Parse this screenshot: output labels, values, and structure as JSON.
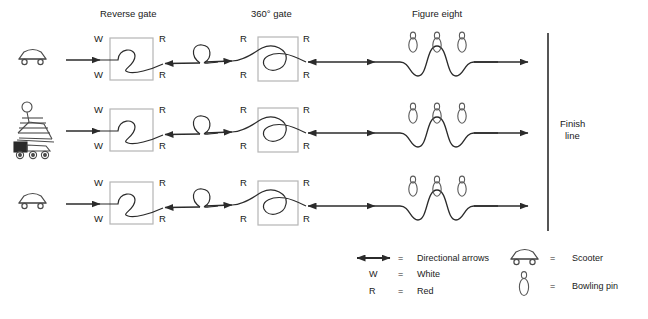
{
  "diagram": {
    "section_headers": [
      {
        "label": "Reverse gate",
        "x": 100,
        "y": 8
      },
      {
        "label": "360° gate",
        "x": 251,
        "y": 8
      },
      {
        "label": "Figure eight",
        "x": 410,
        "y": 8
      },
      {
        "label": "Finish",
        "x": 564,
        "y": 119
      },
      {
        "label": "line",
        "x": 567,
        "y": 131
      }
    ],
    "finish_line": {
      "x": 548,
      "y_top": 33,
      "y_bottom": 231,
      "color": "#2b2b2b"
    },
    "rows": [
      {
        "id": "row-1",
        "vehicle": "scooter",
        "baseline_y": 60,
        "reverse_gate": {
          "top_left": "W",
          "top_right": "R",
          "bottom_left": "W",
          "bottom_right": "R"
        },
        "gate_360": {
          "top_left": "R",
          "top_right": "R",
          "bottom_left": "R",
          "bottom_right": "R"
        },
        "bowling_pins": 3
      },
      {
        "id": "row-2",
        "vehicle": "power-wheelchair",
        "baseline_y": 131,
        "reverse_gate": {
          "top_left": "W",
          "top_right": "R",
          "bottom_left": "W",
          "bottom_right": "R"
        },
        "gate_360": {
          "top_left": "R",
          "top_right": "R",
          "bottom_left": "R",
          "bottom_right": "R"
        },
        "bowling_pins": 3
      },
      {
        "id": "row-3",
        "vehicle": "scooter",
        "baseline_y": 204,
        "reverse_gate": {
          "top_left": "W",
          "top_right": "R",
          "bottom_left": "W",
          "bottom_right": "R"
        },
        "gate_360": {
          "top_left": "R",
          "top_right": "R",
          "bottom_left": "R",
          "bottom_right": "R"
        },
        "bowling_pins": 3
      }
    ],
    "colors": {
      "stroke": "#2b2b2b",
      "gate_box": "#b5b5b5",
      "pin_outline": "#5a5a5a",
      "background": "#ffffff"
    }
  },
  "legend": {
    "left_column": [
      {
        "symbol": "directional-arrows-icon",
        "equals": "=",
        "label": "Directional arrows"
      },
      {
        "symbol": "W",
        "equals": "=",
        "label": "White"
      },
      {
        "symbol": "R",
        "equals": "=",
        "label": "Red"
      }
    ],
    "right_column": [
      {
        "symbol": "scooter-icon",
        "equals": "=",
        "label": "Scooter"
      },
      {
        "symbol": "bowling-pin-icon",
        "equals": "=",
        "label": "Bowling pin"
      }
    ]
  }
}
